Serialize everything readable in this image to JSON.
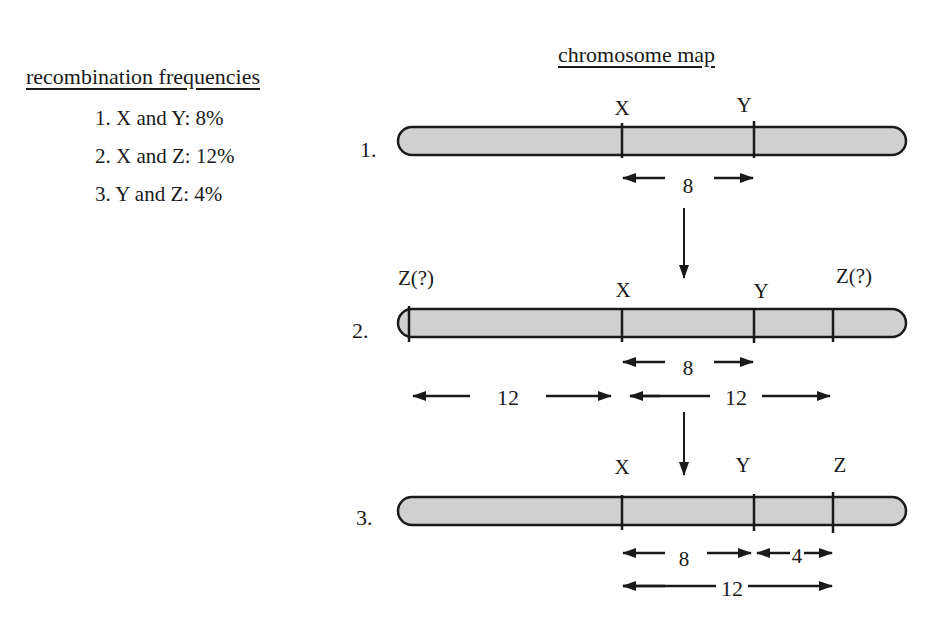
{
  "recombination": {
    "title": "recombination frequencies",
    "items": [
      {
        "label": "1. X and Y: 8%"
      },
      {
        "label": "2. X and Z: 12%"
      },
      {
        "label": "3. Y and Z: 4%"
      }
    ]
  },
  "map": {
    "title": "chromosome map",
    "chromosome_fill": "#d0d0d0",
    "outline_color": "#1a1a1a",
    "rows": [
      {
        "num": "1.",
        "genes": {
          "x": "X",
          "y": "Y"
        },
        "dist_xy": "8"
      },
      {
        "num": "2.",
        "genes": {
          "z_left": "Z(?)",
          "x": "X",
          "y": "Y",
          "z_right": "Z(?)"
        },
        "dist_xy": "8",
        "dist_left": "12",
        "dist_right": "12"
      },
      {
        "num": "3.",
        "genes": {
          "x": "X",
          "y": "Y",
          "z": "Z"
        },
        "dist_xy": "8",
        "dist_yz": "4",
        "dist_xz": "12"
      }
    ]
  }
}
